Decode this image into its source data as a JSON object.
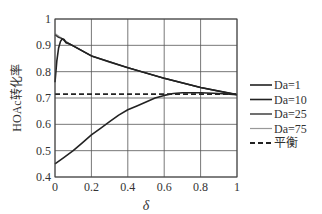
{
  "chart_data": {
    "type": "line",
    "title": "",
    "xlabel": "δ",
    "ylabel": "HOAc转化率",
    "xlim": [
      0,
      1
    ],
    "ylim": [
      0.4,
      1.0
    ],
    "xticks": [
      "0",
      "0.2",
      "0.4",
      "0.6",
      "0.8",
      "1"
    ],
    "yticks": [
      "0.4",
      "0.5",
      "0.6",
      "0.7",
      "0.8",
      "0.9",
      "1"
    ],
    "grid": true,
    "legend_position": "right",
    "series": [
      {
        "name": "Da=1",
        "color": "#222222",
        "width": 1.6,
        "dash": "",
        "x": [
          0,
          0.05,
          0.1,
          0.15,
          0.2,
          0.25,
          0.3,
          0.35,
          0.4,
          0.45,
          0.5,
          0.55,
          0.6,
          0.65,
          0.7,
          0.8,
          0.9,
          1.0
        ],
        "y": [
          0.45,
          0.475,
          0.5,
          0.53,
          0.56,
          0.585,
          0.61,
          0.635,
          0.655,
          0.67,
          0.685,
          0.7,
          0.71,
          0.717,
          0.72,
          0.72,
          0.717,
          0.712
        ]
      },
      {
        "name": "Da=10",
        "color": "#222222",
        "width": 1.6,
        "dash": "",
        "x": [
          0,
          0.01,
          0.02,
          0.03,
          0.04,
          0.05,
          0.06,
          0.08,
          0.1,
          0.2,
          0.4,
          0.6,
          0.8,
          1.0
        ],
        "y": [
          0.76,
          0.84,
          0.89,
          0.915,
          0.925,
          0.922,
          0.91,
          0.905,
          0.898,
          0.86,
          0.815,
          0.775,
          0.74,
          0.713
        ]
      },
      {
        "name": "Da=25",
        "color": "#333333",
        "width": 1.4,
        "dash": "",
        "x": [
          0,
          0.02,
          0.04,
          0.06,
          0.08,
          0.1,
          0.2,
          0.4,
          0.6,
          0.8,
          1.0
        ],
        "y": [
          0.94,
          0.93,
          0.925,
          0.912,
          0.905,
          0.898,
          0.86,
          0.815,
          0.775,
          0.74,
          0.713
        ]
      },
      {
        "name": "Da=75",
        "color": "#999999",
        "width": 1.2,
        "dash": "",
        "x": [
          0,
          0.05,
          0.1,
          0.2,
          0.3,
          0.4,
          0.5,
          0.6,
          0.7,
          0.8,
          0.9,
          1.0
        ],
        "y": [
          0.945,
          0.92,
          0.898,
          0.86,
          0.835,
          0.815,
          0.795,
          0.775,
          0.757,
          0.74,
          0.725,
          0.713
        ]
      },
      {
        "name": "平衡",
        "color": "#222222",
        "width": 1.8,
        "dash": "5,3",
        "x": [
          0,
          1.0
        ],
        "y": [
          0.715,
          0.715
        ]
      }
    ]
  }
}
